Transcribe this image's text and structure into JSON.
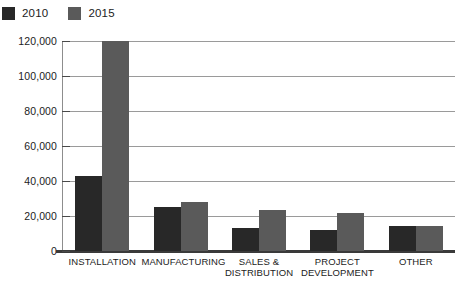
{
  "legend": {
    "items": [
      {
        "label": "2010",
        "color": "#282828"
      },
      {
        "label": "2015",
        "color": "#5a5a5a"
      }
    ]
  },
  "chart_data": {
    "type": "bar",
    "title": "",
    "subtitle": "",
    "xlabel": "",
    "ylabel": "",
    "ylim": [
      0,
      120000
    ],
    "grid": true,
    "legend_position": "top-left",
    "categories": [
      "INSTALLATION",
      "MANUFACTURING",
      "SALES & DISTRIBUTION",
      "PROJECT DEVELOPMENT",
      "OTHER"
    ],
    "ytick_labels": [
      "0",
      "20,000",
      "40,000",
      "60,000",
      "80,000",
      "100,000",
      "120,000"
    ],
    "ytick_values": [
      0,
      20000,
      40000,
      60000,
      80000,
      100000,
      120000
    ],
    "series": [
      {
        "name": "2010",
        "color": "#282828",
        "values": [
          43000,
          25000,
          13000,
          12000,
          14500
        ]
      },
      {
        "name": "2015",
        "color": "#5a5a5a",
        "values": [
          120000,
          28000,
          23500,
          21500,
          14500
        ]
      }
    ]
  }
}
